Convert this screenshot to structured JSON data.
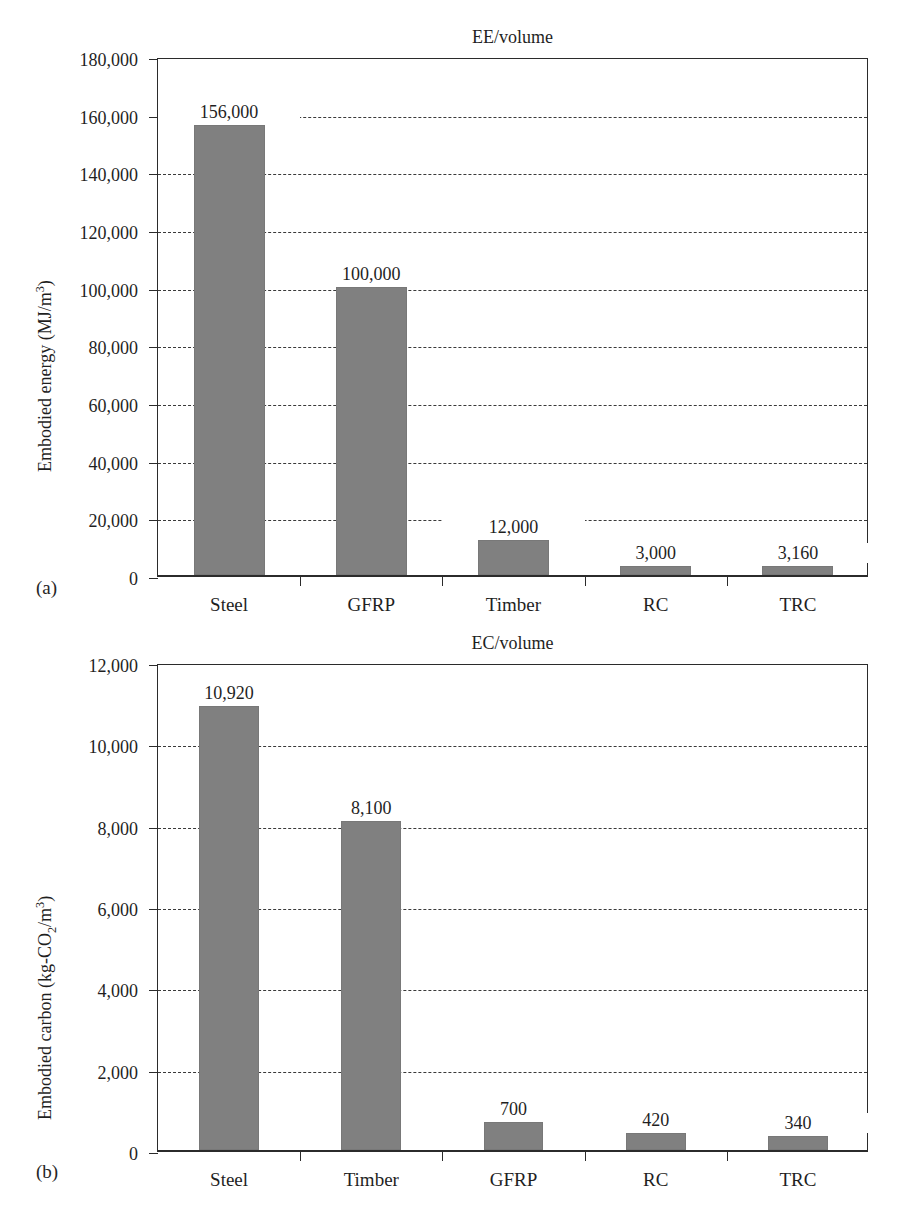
{
  "figure": {
    "panels": [
      {
        "panel_label": "(a)",
        "title": "EE/volume",
        "y_axis_title_html": "Embodied energy (MJ/m<sup>3</sup>)"
      },
      {
        "panel_label": "(b)",
        "title": "EC/volume",
        "y_axis_title_html": "Embodied carbon (kg-CO<sub>2</sub>/m<sup>3</sup>)"
      }
    ]
  },
  "chart_data": [
    {
      "type": "bar",
      "title": "EE/volume",
      "panel": "(a)",
      "xlabel": "",
      "ylabel": "Embodied energy (MJ/m3)",
      "ylim": [
        0,
        180000
      ],
      "ytick_step": 20000,
      "ytick_labels": [
        "0",
        "20,000",
        "40,000",
        "60,000",
        "80,000",
        "100,000",
        "120,000",
        "140,000",
        "160,000",
        "180,000"
      ],
      "ytick_values": [
        0,
        20000,
        40000,
        60000,
        80000,
        100000,
        120000,
        140000,
        160000,
        180000
      ],
      "grid": true,
      "legend": "none",
      "bar_color": "#808080",
      "categories": [
        "Steel",
        "GFRP",
        "Timber",
        "RC",
        "TRC"
      ],
      "values": [
        156000,
        100000,
        12000,
        3000,
        3160
      ],
      "value_labels": [
        "156,000",
        "100,000",
        "12,000",
        "3,000",
        "3,160"
      ]
    },
    {
      "type": "bar",
      "title": "EC/volume",
      "panel": "(b)",
      "xlabel": "",
      "ylabel": "Embodied carbon (kg-CO2/m3)",
      "ylim": [
        0,
        12000
      ],
      "ytick_step": 2000,
      "ytick_labels": [
        "0",
        "2,000",
        "4,000",
        "6,000",
        "8,000",
        "10,000",
        "12,000"
      ],
      "ytick_values": [
        0,
        2000,
        4000,
        6000,
        8000,
        10000,
        12000
      ],
      "grid": true,
      "legend": "none",
      "bar_color": "#808080",
      "categories": [
        "Steel",
        "Timber",
        "GFRP",
        "RC",
        "TRC"
      ],
      "values": [
        10920,
        8100,
        700,
        420,
        340
      ],
      "value_labels": [
        "10,920",
        "8,100",
        "700",
        "420",
        "340"
      ]
    }
  ]
}
